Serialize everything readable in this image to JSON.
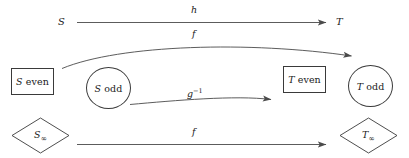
{
  "diagram": {
    "colors": {
      "stroke": "#3a3a3a",
      "arrow": "#4a4a4a",
      "text": "#1a1a1a",
      "background": "#ffffff"
    },
    "objects": [
      {
        "id": "s-top",
        "label_italic": "S",
        "label_upright": "",
        "shape": "none"
      },
      {
        "id": "t-top",
        "label_italic": "T",
        "label_upright": "",
        "shape": "none"
      },
      {
        "id": "s-even",
        "label_italic": "S",
        "label_upright": " even",
        "shape": "rectangle"
      },
      {
        "id": "s-odd",
        "label_italic": "S",
        "label_upright": " odd",
        "shape": "circle"
      },
      {
        "id": "t-even",
        "label_italic": "T",
        "label_upright": " even",
        "shape": "rectangle"
      },
      {
        "id": "t-odd",
        "label_italic": "T",
        "label_upright": " odd",
        "shape": "circle"
      },
      {
        "id": "s-infty",
        "label_italic": "S",
        "label_subscript": "∞",
        "shape": "diamond"
      },
      {
        "id": "t-infty",
        "label_italic": "T",
        "label_subscript": "∞",
        "shape": "diamond"
      }
    ],
    "arrows": [
      {
        "id": "arrow-h",
        "label": "h",
        "label_superscript": "",
        "style": "straight",
        "from": "s-top",
        "to": "t-top"
      },
      {
        "id": "arrow-f-top",
        "label": "f",
        "label_superscript": "",
        "style": "curved",
        "from": "s-even",
        "to": "t-odd"
      },
      {
        "id": "arrow-g-inverse",
        "label": "g",
        "label_superscript": "−1",
        "style": "curved",
        "from": "s-odd",
        "to": "t-even"
      },
      {
        "id": "arrow-f-bottom",
        "label": "f",
        "label_superscript": "",
        "style": "straight",
        "from": "s-infty",
        "to": "t-infty"
      }
    ]
  }
}
